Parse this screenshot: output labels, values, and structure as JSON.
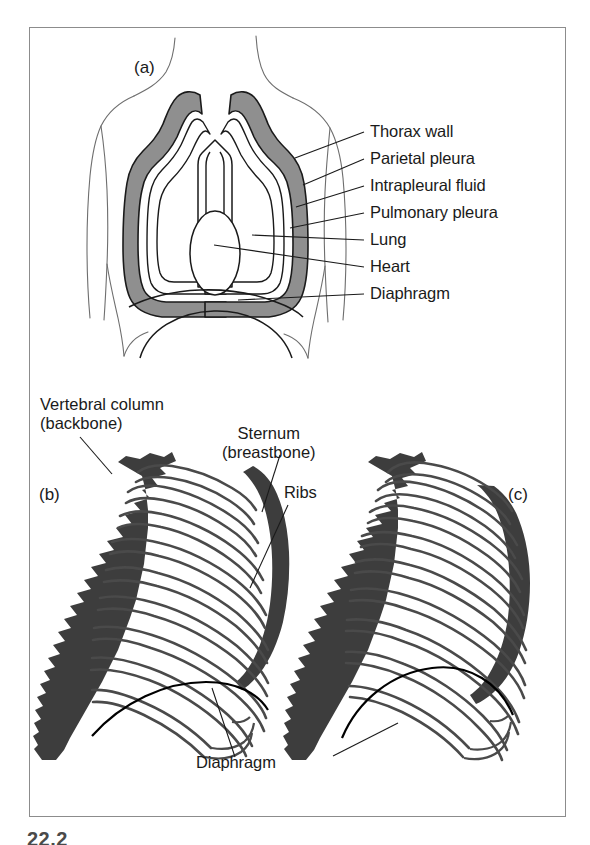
{
  "figure": {
    "caption_fragment": "22.2",
    "frame_color": "#8c8c8c",
    "background": "#ffffff"
  },
  "colors": {
    "ink": "#1a1a1a",
    "bone_fill": "#3d3d3d",
    "pleura_shade": "#8f8f8f",
    "body_outline": "#6e6e6e",
    "leader_line": "#1a1a1a"
  },
  "panels": [
    {
      "id": "a",
      "tag": "(a)",
      "description": "Frontal section of the thorax showing lungs, pleural membranes, heart and diaphragm",
      "labels": [
        {
          "key": "thorax_wall",
          "text": "Thorax wall"
        },
        {
          "key": "parietal_pleura",
          "text": "Parietal pleura"
        },
        {
          "key": "intrapleural_fluid",
          "text": "Intrapleural fluid"
        },
        {
          "key": "pulmonary_pleura",
          "text": "Pulmonary pleura"
        },
        {
          "key": "lung",
          "text": "Lung"
        },
        {
          "key": "heart",
          "text": "Heart"
        },
        {
          "key": "diaphragm",
          "text": "Diaphragm"
        }
      ]
    },
    {
      "id": "b",
      "tag": "(b)",
      "description": "Lateral view of rib cage at expiration, ribs lowered, diaphragm domed"
    },
    {
      "id": "c",
      "tag": "(c)",
      "description": "Lateral view of rib cage at inspiration, ribs raised, diaphragm flattened"
    }
  ],
  "shared_labels": [
    {
      "key": "vertebral_column",
      "line1": "Vertebral column",
      "line2": "(backbone)"
    },
    {
      "key": "sternum",
      "line1": "Sternum",
      "line2": "(breastbone)"
    },
    {
      "key": "ribs",
      "line1": "Ribs",
      "line2": ""
    },
    {
      "key": "diaphragm_lower",
      "line1": "Diaphragm",
      "line2": ""
    }
  ]
}
